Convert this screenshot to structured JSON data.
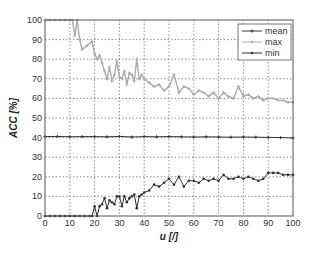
{
  "chart_data": {
    "type": "line",
    "title": "",
    "xlabel": "u [/]",
    "ylabel": "ACC [%]",
    "xlim": [
      0,
      100
    ],
    "ylim": [
      0,
      100
    ],
    "xticks": [
      0,
      10,
      20,
      30,
      40,
      50,
      60,
      70,
      80,
      90,
      100
    ],
    "yticks": [
      0,
      10,
      20,
      30,
      40,
      50,
      60,
      70,
      80,
      90,
      100
    ],
    "grid": true,
    "legend_position": "upper right",
    "legend": [
      "mean",
      "max",
      "min"
    ],
    "series": [
      {
        "name": "mean",
        "color": "#333333",
        "marker": "plus",
        "x": [
          0,
          5,
          10,
          15,
          20,
          25,
          30,
          35,
          40,
          45,
          50,
          55,
          60,
          65,
          70,
          75,
          80,
          85,
          90,
          95,
          100
        ],
        "values": [
          40.5,
          40.6,
          40.4,
          40.5,
          40.5,
          40.4,
          40.6,
          40.3,
          40.5,
          40.4,
          40.5,
          40.4,
          40.3,
          40.4,
          40.3,
          40.2,
          40.3,
          40.2,
          40.1,
          40.0,
          39.8
        ]
      },
      {
        "name": "max",
        "color": "#aaaaaa",
        "marker": "plus",
        "x": [
          0,
          2,
          4,
          6,
          8,
          10,
          11,
          12,
          13,
          14,
          15,
          17,
          19,
          20,
          21,
          22,
          23,
          24,
          25,
          26,
          27,
          28,
          29,
          30,
          31,
          32,
          33,
          34,
          35,
          36,
          37,
          38,
          39,
          40,
          42,
          44,
          46,
          48,
          50,
          52,
          54,
          56,
          58,
          60,
          62,
          64,
          66,
          68,
          70,
          72,
          74,
          76,
          78,
          80,
          82,
          84,
          86,
          88,
          90,
          92,
          94,
          96,
          98,
          100
        ],
        "values": [
          100,
          100,
          100,
          100,
          100,
          100,
          100,
          92,
          100,
          90,
          85,
          87,
          89,
          83,
          80,
          82,
          78,
          74,
          70,
          76,
          69,
          72,
          79,
          71,
          70,
          74,
          67,
          73,
          72,
          69,
          80,
          70,
          72,
          70,
          68,
          66,
          67,
          64,
          66,
          72,
          63,
          66,
          65,
          62,
          64,
          63,
          61,
          63,
          60,
          63,
          61,
          60,
          66,
          61,
          62,
          60,
          61,
          59,
          60,
          60,
          59,
          59,
          58,
          58
        ]
      },
      {
        "name": "min",
        "color": "#333333",
        "marker": "dot",
        "x": [
          0,
          2,
          4,
          6,
          8,
          10,
          12,
          14,
          16,
          18,
          19,
          20,
          21,
          22,
          23,
          24,
          25,
          26,
          27,
          28,
          29,
          30,
          31,
          32,
          33,
          34,
          35,
          36,
          37,
          38,
          39,
          40,
          42,
          44,
          46,
          48,
          50,
          52,
          54,
          56,
          58,
          60,
          62,
          64,
          66,
          68,
          70,
          72,
          74,
          76,
          78,
          80,
          82,
          84,
          86,
          88,
          90,
          92,
          94,
          96,
          98,
          100
        ],
        "values": [
          0,
          0,
          0,
          0,
          0,
          0,
          0,
          0,
          0,
          0,
          0,
          5,
          0,
          5,
          6,
          9,
          4,
          8,
          7,
          6,
          10,
          10,
          5,
          10,
          7,
          9,
          10,
          11,
          4,
          10,
          11,
          12,
          13,
          16,
          15,
          17,
          19,
          16,
          20,
          15,
          18,
          18,
          17,
          19,
          18,
          19,
          18,
          21,
          19,
          19,
          20,
          19,
          20,
          19,
          18,
          19,
          22,
          22,
          22,
          21,
          21,
          21
        ]
      }
    ]
  }
}
